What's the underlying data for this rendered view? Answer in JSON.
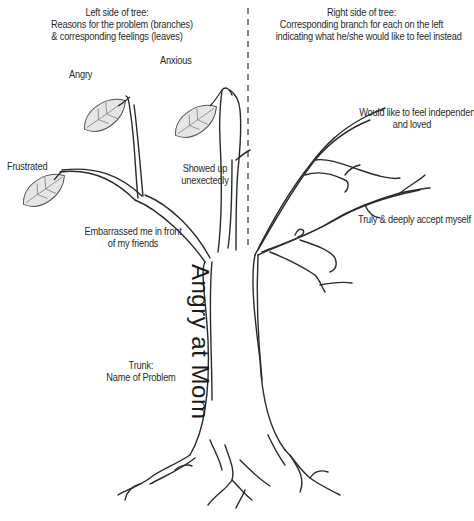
{
  "header": {
    "left": {
      "line1": "Left side of tree:",
      "line2": "Reasons for the problem (branches)",
      "line3": "& corresponding feelings (leaves)"
    },
    "right": {
      "line1": "Right side of tree:",
      "line2": "Corresponding branch for each on the left",
      "line3": "indicating what he/she would like to feel instead"
    }
  },
  "leaves": [
    {
      "label": "Angry"
    },
    {
      "label": "Anxious"
    },
    {
      "label": "Frustrated"
    }
  ],
  "left_branches": {
    "showed_up_1": "Showed up",
    "showed_up_2": "unexectedly",
    "embarrassed_1": "Embarrassed me in front",
    "embarrassed_2": "of my friends"
  },
  "right_branches": {
    "independent_1": "Would like to feel independent",
    "independent_2": "and loved",
    "accept": "Truly & deeply accept myself"
  },
  "trunk": {
    "label": "Angry at Mom",
    "caption_1": "Trunk:",
    "caption_2": "Name of Problem"
  },
  "colors": {
    "ink": "#2a2a2a",
    "leaf_fill": "#e6e6e6",
    "divider": "#333333"
  }
}
